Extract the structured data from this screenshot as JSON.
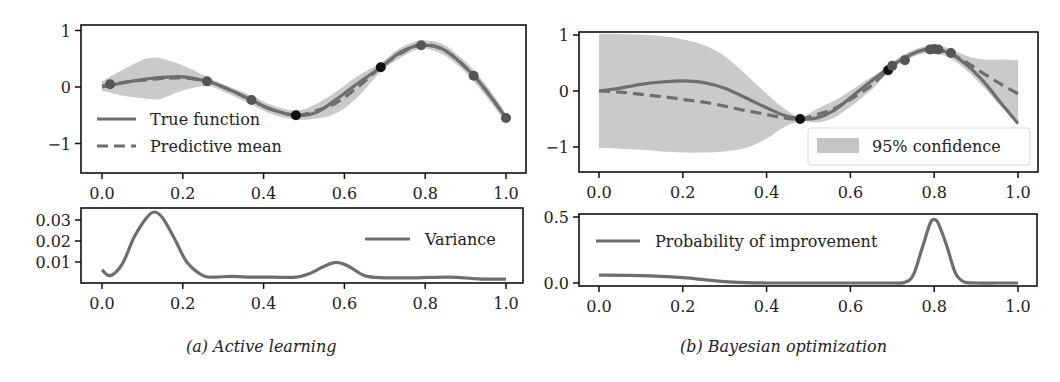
{
  "figure": {
    "captions": {
      "a": "(a) Active learning",
      "b": "(b) Bayesian optimization"
    }
  },
  "colors": {
    "curve": "#6e6e6e",
    "band": "#c4c4c4",
    "point_gray": "#555555",
    "point_black": "#111111",
    "frame": "#111111"
  },
  "chart_data": [
    {
      "id": "a_top",
      "type": "line",
      "title": "",
      "xlabel": "",
      "ylabel": "",
      "xlim": [
        -0.02,
        1.05
      ],
      "ylim": [
        -1.5,
        1.1
      ],
      "xticks": [
        0.0,
        0.2,
        0.4,
        0.6,
        0.8,
        1.0
      ],
      "xtick_labels": [
        "0.0",
        "0.2",
        "0.4",
        "0.6",
        "0.8",
        "1.0"
      ],
      "yticks": [
        1,
        0,
        -1
      ],
      "ytick_labels": [
        "1",
        "0",
        "−1"
      ],
      "grid": false,
      "legend_position": "lower left",
      "legend": [
        "True function",
        "Predictive mean"
      ],
      "x": [
        0.0,
        0.05,
        0.1,
        0.13,
        0.15,
        0.2,
        0.26,
        0.3,
        0.37,
        0.42,
        0.48,
        0.53,
        0.58,
        0.63,
        0.69,
        0.74,
        0.79,
        0.84,
        0.88,
        0.92,
        0.96,
        1.0
      ],
      "series": [
        {
          "name": "True function",
          "style": "solid",
          "values": [
            0.0,
            0.07,
            0.13,
            0.16,
            0.17,
            0.18,
            0.1,
            0.0,
            -0.23,
            -0.4,
            -0.5,
            -0.45,
            -0.22,
            0.05,
            0.35,
            0.62,
            0.74,
            0.68,
            0.48,
            0.2,
            -0.15,
            -0.55
          ]
        },
        {
          "name": "Predictive mean",
          "style": "dashed",
          "values": [
            0.02,
            0.08,
            0.12,
            0.14,
            0.15,
            0.16,
            0.1,
            0.0,
            -0.23,
            -0.4,
            -0.5,
            -0.42,
            -0.28,
            -0.02,
            0.35,
            0.6,
            0.75,
            0.68,
            0.48,
            0.2,
            -0.15,
            -0.55
          ]
        },
        {
          "name": "95% confidence upper",
          "style": "band_upper",
          "values": [
            0.1,
            0.3,
            0.48,
            0.52,
            0.5,
            0.38,
            0.18,
            0.05,
            -0.15,
            -0.32,
            -0.42,
            -0.3,
            -0.08,
            0.18,
            0.43,
            0.7,
            0.82,
            0.77,
            0.57,
            0.3,
            -0.05,
            -0.47
          ]
        },
        {
          "name": "95% confidence lower",
          "style": "band_lower",
          "values": [
            -0.06,
            -0.15,
            -0.2,
            -0.22,
            -0.2,
            -0.06,
            0.02,
            -0.08,
            -0.31,
            -0.48,
            -0.58,
            -0.56,
            -0.46,
            -0.2,
            0.27,
            0.52,
            0.68,
            0.59,
            0.39,
            0.1,
            -0.25,
            -0.63
          ]
        }
      ],
      "points": [
        {
          "x": 0.02,
          "y": 0.05,
          "color": "gray"
        },
        {
          "x": 0.26,
          "y": 0.1,
          "color": "gray"
        },
        {
          "x": 0.37,
          "y": -0.23,
          "color": "gray"
        },
        {
          "x": 0.48,
          "y": -0.5,
          "color": "black"
        },
        {
          "x": 0.69,
          "y": 0.35,
          "color": "black"
        },
        {
          "x": 0.79,
          "y": 0.74,
          "color": "gray"
        },
        {
          "x": 0.92,
          "y": 0.2,
          "color": "gray"
        },
        {
          "x": 1.0,
          "y": -0.55,
          "color": "gray"
        }
      ],
      "frame_px": {
        "left": 81,
        "top": 25,
        "right": 526,
        "bottom": 173
      },
      "map_px": {
        "x0": 102,
        "x1": 506,
        "y_at_0": 87,
        "px_per_unit": 56.5
      }
    },
    {
      "id": "a_bottom",
      "type": "line",
      "title": "",
      "xlabel": "",
      "ylabel": "",
      "xlim": [
        -0.02,
        1.05
      ],
      "ylim": [
        0.0,
        0.035
      ],
      "xticks": [
        0.0,
        0.2,
        0.4,
        0.6,
        0.8,
        1.0
      ],
      "xtick_labels": [
        "0.0",
        "0.2",
        "0.4",
        "0.6",
        "0.8",
        "1.0"
      ],
      "yticks": [
        0.03,
        0.02,
        0.01
      ],
      "ytick_labels": [
        "0.03",
        "0.02",
        "0.01"
      ],
      "grid": false,
      "legend_position": "upper right",
      "legend": [
        "Variance"
      ],
      "x": [
        0.0,
        0.02,
        0.05,
        0.08,
        0.11,
        0.13,
        0.15,
        0.18,
        0.21,
        0.25,
        0.28,
        0.32,
        0.36,
        0.42,
        0.48,
        0.52,
        0.55,
        0.58,
        0.61,
        0.65,
        0.7,
        0.78,
        0.86,
        0.93,
        1.0
      ],
      "series": [
        {
          "name": "Variance",
          "style": "solid",
          "values": [
            0.0063,
            0.0035,
            0.009,
            0.022,
            0.031,
            0.0338,
            0.031,
            0.021,
            0.01,
            0.0035,
            0.0028,
            0.0032,
            0.0028,
            0.0028,
            0.0028,
            0.005,
            0.008,
            0.0098,
            0.008,
            0.0035,
            0.0025,
            0.0025,
            0.0028,
            0.002,
            0.0018
          ]
        }
      ],
      "frame_px": {
        "left": 81,
        "top": 208,
        "right": 523,
        "bottom": 283
      },
      "map_px": {
        "x0": 102,
        "x1": 506,
        "y_at_0": 283,
        "px_per_unit": 2100
      }
    },
    {
      "id": "b_top",
      "type": "line",
      "title": "",
      "xlabel": "",
      "ylabel": "",
      "xlim": [
        -0.02,
        1.05
      ],
      "ylim": [
        -1.5,
        1.1
      ],
      "xticks": [
        0.0,
        0.2,
        0.4,
        0.6,
        0.8,
        1.0
      ],
      "xtick_labels": [
        "0.0",
        "0.2",
        "0.4",
        "0.6",
        "0.8",
        "1.0"
      ],
      "yticks": [
        1,
        0,
        -1
      ],
      "ytick_labels": [
        "1",
        "0",
        "−1"
      ],
      "grid": false,
      "legend_position": "lower right",
      "legend": [
        "95% confidence"
      ],
      "x": [
        0.0,
        0.05,
        0.1,
        0.15,
        0.2,
        0.25,
        0.3,
        0.35,
        0.4,
        0.44,
        0.48,
        0.52,
        0.56,
        0.6,
        0.65,
        0.69,
        0.72,
        0.76,
        0.8,
        0.84,
        0.88,
        0.92,
        0.96,
        1.0
      ],
      "series": [
        {
          "name": "True function",
          "style": "solid",
          "values": [
            0.0,
            0.05,
            0.12,
            0.16,
            0.18,
            0.15,
            0.05,
            -0.12,
            -0.3,
            -0.43,
            -0.5,
            -0.48,
            -0.35,
            -0.12,
            0.18,
            0.4,
            0.55,
            0.7,
            0.75,
            0.66,
            0.45,
            0.15,
            -0.22,
            -0.58
          ]
        },
        {
          "name": "Predictive mean",
          "style": "dashed",
          "values": [
            0.0,
            -0.02,
            -0.06,
            -0.1,
            -0.15,
            -0.2,
            -0.27,
            -0.35,
            -0.42,
            -0.48,
            -0.5,
            -0.42,
            -0.32,
            -0.15,
            0.1,
            0.38,
            0.55,
            0.7,
            0.75,
            0.66,
            0.5,
            0.3,
            0.12,
            -0.05
          ]
        },
        {
          "name": "95% confidence upper",
          "style": "band_upper",
          "values": [
            1.02,
            1.02,
            1.01,
            0.98,
            0.92,
            0.82,
            0.62,
            0.3,
            -0.05,
            -0.3,
            -0.46,
            -0.32,
            -0.18,
            0.0,
            0.25,
            0.44,
            0.62,
            0.76,
            0.82,
            0.75,
            0.62,
            0.56,
            0.56,
            0.55
          ]
        },
        {
          "name": "95% confidence lower",
          "style": "band_lower",
          "values": [
            -1.02,
            -1.03,
            -1.05,
            -1.08,
            -1.1,
            -1.1,
            -1.08,
            -1.02,
            -0.85,
            -0.65,
            -0.54,
            -0.56,
            -0.48,
            -0.28,
            0.02,
            0.33,
            0.5,
            0.64,
            0.68,
            0.58,
            0.35,
            0.05,
            -0.28,
            -0.6
          ]
        }
      ],
      "points": [
        {
          "x": 0.48,
          "y": -0.5,
          "color": "black"
        },
        {
          "x": 0.69,
          "y": 0.37,
          "color": "black"
        },
        {
          "x": 0.7,
          "y": 0.45,
          "color": "gray"
        },
        {
          "x": 0.73,
          "y": 0.55,
          "color": "gray"
        },
        {
          "x": 0.79,
          "y": 0.74,
          "color": "gray"
        },
        {
          "x": 0.8,
          "y": 0.75,
          "color": "gray"
        },
        {
          "x": 0.81,
          "y": 0.74,
          "color": "gray"
        },
        {
          "x": 0.84,
          "y": 0.68,
          "color": "gray"
        }
      ],
      "frame_px": {
        "left": 579,
        "top": 32,
        "right": 1038,
        "bottom": 172
      },
      "map_px": {
        "x0": 599,
        "x1": 1018,
        "y_at_0": 91,
        "px_per_unit": 56
      }
    },
    {
      "id": "b_bottom",
      "type": "line",
      "title": "",
      "xlabel": "",
      "ylabel": "",
      "xlim": [
        -0.02,
        1.05
      ],
      "ylim": [
        0.0,
        0.5
      ],
      "xticks": [
        0.0,
        0.2,
        0.4,
        0.6,
        0.8,
        1.0
      ],
      "xtick_labels": [
        "0.0",
        "0.2",
        "0.4",
        "0.6",
        "0.8",
        "1.0"
      ],
      "yticks": [
        0.5,
        0.0
      ],
      "ytick_labels": [
        "0.5",
        "0.0"
      ],
      "grid": false,
      "legend_position": "upper left",
      "legend": [
        "Probability of improvement"
      ],
      "x": [
        0.0,
        0.1,
        0.2,
        0.25,
        0.3,
        0.35,
        0.4,
        0.5,
        0.6,
        0.7,
        0.73,
        0.75,
        0.77,
        0.79,
        0.8,
        0.81,
        0.83,
        0.85,
        0.87,
        0.9,
        0.95,
        1.0
      ],
      "series": [
        {
          "name": "Probability of improvement",
          "style": "solid",
          "values": [
            0.06,
            0.055,
            0.04,
            0.025,
            0.01,
            0.003,
            0.0,
            0.0,
            0.0,
            0.0,
            0.005,
            0.06,
            0.25,
            0.45,
            0.48,
            0.45,
            0.28,
            0.08,
            0.01,
            0.0,
            0.0,
            0.0
          ]
        }
      ],
      "frame_px": {
        "left": 579,
        "top": 214,
        "right": 1037,
        "bottom": 286
      },
      "map_px": {
        "x0": 599,
        "x1": 1018,
        "y_at_0": 283,
        "px_per_unit": 132
      }
    }
  ]
}
